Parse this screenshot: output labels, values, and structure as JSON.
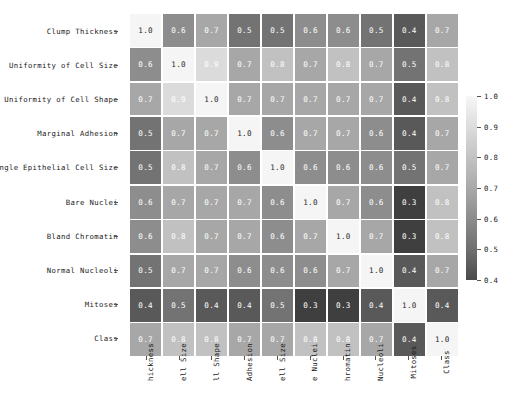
{
  "chart_data": {
    "type": "heatmap",
    "title": "",
    "xlabel": "",
    "ylabel": "",
    "colormap": "grayscale",
    "grid": true,
    "annotated": true,
    "legend_position": "right",
    "colorbar": {
      "vmin": 0.4,
      "vmax": 1.0,
      "ticks": [
        "1.0",
        "0.9",
        "0.8",
        "0.7",
        "0.6",
        "0.5",
        "0.4"
      ],
      "tick_values": [
        1.0,
        0.9,
        0.8,
        0.7,
        0.6,
        0.5,
        0.4
      ]
    },
    "row_labels": [
      "Clump Thickness",
      "Uniformity of Cell Size",
      "Uniformity of Cell Shape",
      "Marginal Adhesion",
      "Single Epithelial Cell Size",
      "Bare Nuclei",
      "Bland Chromatin",
      "Normal Nucleoli",
      "Mitoses",
      "Class"
    ],
    "column_labels": [
      "hickness",
      "ell Size",
      "ll Shape",
      "Adhesion",
      "ell Size",
      "e Nuclei",
      "hromatin",
      "Nucleoli",
      "Mitoses",
      "Class"
    ],
    "values": [
      [
        1.0,
        0.6,
        0.7,
        0.5,
        0.5,
        0.6,
        0.6,
        0.5,
        0.4,
        0.7
      ],
      [
        0.6,
        1.0,
        0.9,
        0.7,
        0.8,
        0.7,
        0.8,
        0.7,
        0.5,
        0.8
      ],
      [
        0.7,
        0.9,
        1.0,
        0.7,
        0.7,
        0.7,
        0.7,
        0.7,
        0.4,
        0.8
      ],
      [
        0.5,
        0.7,
        0.7,
        1.0,
        0.6,
        0.7,
        0.7,
        0.6,
        0.4,
        0.7
      ],
      [
        0.5,
        0.8,
        0.7,
        0.6,
        1.0,
        0.6,
        0.6,
        0.6,
        0.5,
        0.7
      ],
      [
        0.6,
        0.7,
        0.7,
        0.7,
        0.6,
        1.0,
        0.7,
        0.6,
        0.3,
        0.8
      ],
      [
        0.6,
        0.8,
        0.7,
        0.7,
        0.6,
        0.7,
        1.0,
        0.7,
        0.3,
        0.8
      ],
      [
        0.5,
        0.7,
        0.7,
        0.6,
        0.6,
        0.6,
        0.7,
        1.0,
        0.4,
        0.7
      ],
      [
        0.4,
        0.5,
        0.4,
        0.4,
        0.5,
        0.3,
        0.3,
        0.4,
        1.0,
        0.4
      ],
      [
        0.7,
        0.8,
        0.8,
        0.7,
        0.7,
        0.8,
        0.8,
        0.7,
        0.4,
        1.0
      ]
    ],
    "cell_text": [
      [
        "1.0",
        "0.6",
        "0.7",
        "0.5",
        "0.5",
        "0.6",
        "0.6",
        "0.5",
        "0.4",
        "0.7"
      ],
      [
        "0.6",
        "1.0",
        "0.9",
        "0.7",
        "0.8",
        "0.7",
        "0.8",
        "0.7",
        "0.5",
        "0.8"
      ],
      [
        "0.7",
        "0.9",
        "1.0",
        "0.7",
        "0.7",
        "0.7",
        "0.7",
        "0.7",
        "0.4",
        "0.8"
      ],
      [
        "0.5",
        "0.7",
        "0.7",
        "1.0",
        "0.6",
        "0.7",
        "0.7",
        "0.6",
        "0.4",
        "0.7"
      ],
      [
        "0.5",
        "0.8",
        "0.7",
        "0.6",
        "1.0",
        "0.6",
        "0.6",
        "0.6",
        "0.5",
        "0.7"
      ],
      [
        "0.6",
        "0.7",
        "0.7",
        "0.7",
        "0.6",
        "1.0",
        "0.7",
        "0.6",
        "0.3",
        "0.8"
      ],
      [
        "0.6",
        "0.8",
        "0.7",
        "0.7",
        "0.6",
        "0.7",
        "1.0",
        "0.7",
        "0.3",
        "0.8"
      ],
      [
        "0.5",
        "0.7",
        "0.7",
        "0.6",
        "0.6",
        "0.6",
        "0.7",
        "1.0",
        "0.4",
        "0.7"
      ],
      [
        "0.4",
        "0.5",
        "0.4",
        "0.4",
        "0.5",
        "0.3",
        "0.3",
        "0.4",
        "1.0",
        "0.4"
      ],
      [
        "0.7",
        "0.8",
        "0.8",
        "0.7",
        "0.7",
        "0.8",
        "0.8",
        "0.7",
        "0.4",
        "1.0"
      ]
    ]
  },
  "colors": {
    "background": "#ffffff",
    "gridline": "#ffffff",
    "text": "#1a1a1a",
    "cell_text_light": "#ffffff",
    "cell_text_dark": "#2b2b2b"
  }
}
